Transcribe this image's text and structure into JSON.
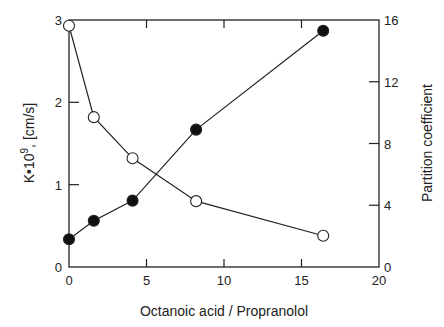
{
  "chart_data": {
    "type": "line",
    "title": "",
    "xlabel": "Octanoic acid / Propranolol",
    "ylabel_left": "K•10⁹ , [cm/s]",
    "ylabel_right": "Partition coefficient",
    "xlim": [
      0,
      20
    ],
    "ylim_left": [
      0,
      3
    ],
    "ylim_right": [
      0,
      16
    ],
    "x_ticks": [
      0,
      5,
      10,
      15,
      20
    ],
    "y_ticks_left": [
      0,
      1,
      2,
      3
    ],
    "y_ticks_right": [
      0,
      4,
      8,
      12,
      16
    ],
    "grid": false,
    "legend": null,
    "series": [
      {
        "name": "K (permeability)",
        "axis": "left",
        "marker": "open-circle",
        "x": [
          0,
          1.6,
          4.1,
          8.2,
          16.4
        ],
        "values": [
          2.93,
          1.82,
          1.32,
          0.8,
          0.38
        ]
      },
      {
        "name": "Partition coefficient",
        "axis": "right",
        "marker": "filled-circle",
        "x": [
          0,
          1.6,
          4.1,
          8.2,
          16.4
        ],
        "values": [
          1.8,
          3.0,
          4.3,
          8.9,
          15.3
        ]
      }
    ]
  },
  "labels": {
    "xlabel": "Octanoic acid / Propranolol",
    "ylabel_left_main": "K•10",
    "ylabel_left_sup": "9",
    "ylabel_left_unit": ",   [cm/s]",
    "ylabel_right": "Partition coefficient"
  }
}
